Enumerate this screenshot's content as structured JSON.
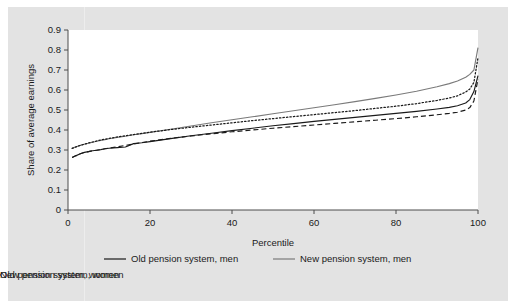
{
  "figure": {
    "background_color": "#ffffff",
    "card_color": "#e3e3e3",
    "plot_background": "#ffffff"
  },
  "chart_data": {
    "type": "line",
    "title": "",
    "xlabel": "Percentile",
    "ylabel": "Share of average earnings",
    "xlim": [
      0,
      100
    ],
    "ylim": [
      0,
      0.9
    ],
    "grid": false,
    "legend_position": "below",
    "xticks": [
      "0",
      "20",
      "40",
      "60",
      "80",
      "100"
    ],
    "xtick_values": [
      0,
      20,
      40,
      60,
      80,
      100
    ],
    "yticks": [
      "0",
      "0.1",
      "0.2",
      "0.3",
      "0.4",
      "0.5",
      "0.6",
      "0.7",
      "0.8",
      "0.9"
    ],
    "ytick_values": [
      0,
      0.1,
      0.2,
      0.3,
      0.4,
      0.5,
      0.6,
      0.7,
      0.8,
      0.9
    ],
    "x": [
      1,
      2,
      3,
      4,
      5,
      6,
      7,
      8,
      9,
      10,
      12,
      14,
      16,
      18,
      20,
      25,
      30,
      35,
      40,
      45,
      50,
      55,
      60,
      65,
      70,
      75,
      80,
      85,
      90,
      93,
      95,
      97,
      98,
      99,
      100
    ],
    "series": [
      {
        "name": "Old pension system, men",
        "style": "solid",
        "color": "#1a1a1a",
        "values": [
          0.262,
          0.272,
          0.281,
          0.288,
          0.292,
          0.296,
          0.299,
          0.302,
          0.306,
          0.309,
          0.312,
          0.315,
          0.332,
          0.336,
          0.342,
          0.357,
          0.371,
          0.384,
          0.397,
          0.409,
          0.421,
          0.432,
          0.443,
          0.453,
          0.463,
          0.473,
          0.483,
          0.493,
          0.505,
          0.513,
          0.521,
          0.535,
          0.552,
          0.592,
          0.672
        ]
      },
      {
        "name": "New pension system, men",
        "style": "solid",
        "color": "#7a7a7a",
        "values": [
          0.308,
          0.316,
          0.323,
          0.329,
          0.334,
          0.339,
          0.344,
          0.348,
          0.352,
          0.356,
          0.363,
          0.369,
          0.376,
          0.382,
          0.388,
          0.404,
          0.42,
          0.436,
          0.451,
          0.466,
          0.481,
          0.496,
          0.511,
          0.526,
          0.542,
          0.558,
          0.575,
          0.594,
          0.616,
          0.632,
          0.645,
          0.664,
          0.678,
          0.7,
          0.812
        ]
      },
      {
        "name": "Old pension system, women",
        "style": "dashed",
        "color": "#1a1a1a",
        "values": [
          0.262,
          0.272,
          0.281,
          0.288,
          0.292,
          0.296,
          0.299,
          0.302,
          0.306,
          0.309,
          0.316,
          0.323,
          0.33,
          0.337,
          0.344,
          0.358,
          0.37,
          0.381,
          0.391,
          0.4,
          0.409,
          0.417,
          0.425,
          0.433,
          0.441,
          0.449,
          0.457,
          0.466,
          0.476,
          0.483,
          0.489,
          0.5,
          0.512,
          0.545,
          0.655
        ]
      },
      {
        "name": "New pension system, women",
        "style": "dotted",
        "color": "#1a1a1a",
        "values": [
          0.308,
          0.316,
          0.323,
          0.329,
          0.335,
          0.34,
          0.345,
          0.35,
          0.354,
          0.358,
          0.365,
          0.371,
          0.377,
          0.383,
          0.389,
          0.402,
          0.414,
          0.425,
          0.436,
          0.447,
          0.457,
          0.467,
          0.477,
          0.487,
          0.497,
          0.508,
          0.519,
          0.532,
          0.548,
          0.56,
          0.571,
          0.59,
          0.605,
          0.638,
          0.762
        ]
      }
    ]
  },
  "legend": {
    "entries": [
      {
        "label": "Old pension system, men",
        "style": "solid",
        "color": "#1a1a1a"
      },
      {
        "label": "New pension system, men",
        "style": "solid",
        "color": "#7a7a7a"
      },
      {
        "label": "Old pension system, women",
        "style": "dashed",
        "color": "#1a1a1a"
      },
      {
        "label": "New pension system, women",
        "style": "dotted",
        "color": "#1a1a1a"
      }
    ]
  }
}
